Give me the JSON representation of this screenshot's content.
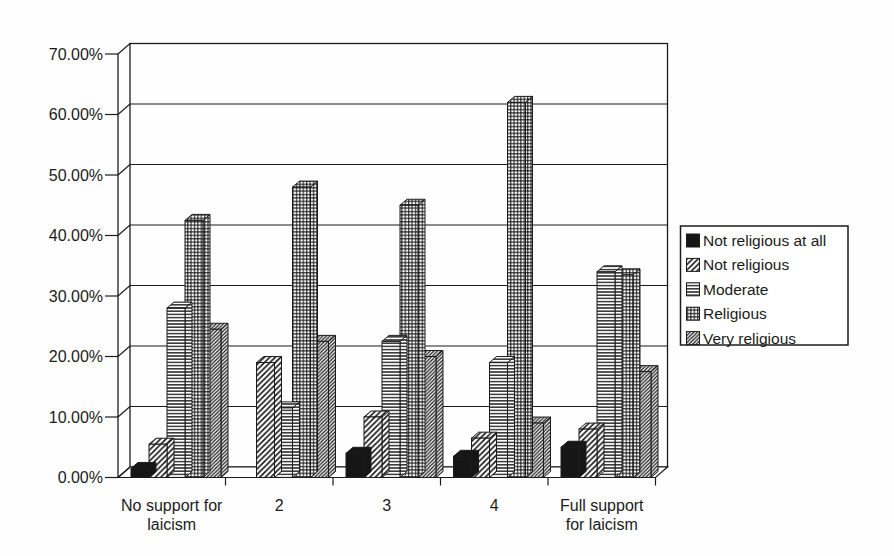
{
  "chart_data": {
    "type": "bar",
    "title": "",
    "xlabel": "",
    "ylabel": "",
    "categories": [
      "No support for\nlaicism",
      "2",
      "3",
      "4",
      "Full support\nfor laicism"
    ],
    "series": [
      {
        "name": "Not religious at all",
        "pattern": "solid",
        "values": [
          1.5,
          0,
          4,
          3.5,
          5
        ]
      },
      {
        "name": "Not religious",
        "pattern": "diag-sparse",
        "values": [
          5.5,
          19,
          10,
          6.5,
          8
        ]
      },
      {
        "name": "Moderate",
        "pattern": "hlines",
        "values": [
          28,
          11.5,
          22.5,
          19,
          34
        ]
      },
      {
        "name": "Religious",
        "pattern": "grid",
        "values": [
          42.5,
          48,
          45,
          62,
          33.5
        ]
      },
      {
        "name": "Very religious",
        "pattern": "diag-dense",
        "values": [
          24.5,
          22.5,
          20,
          9,
          17.5
        ]
      }
    ],
    "ylim": [
      0,
      70
    ],
    "ytick_step": 10,
    "ytick_labels": [
      "0.00%",
      "10.00%",
      "20.00%",
      "30.00%",
      "40.00%",
      "50.00%",
      "60.00%",
      "70.00%"
    ],
    "grid": true,
    "legend_position": "right",
    "style_3d": true,
    "colors": {
      "ink": "#1b1b1b",
      "bar_fill_solid": "#161616",
      "wall": "#fefefe"
    }
  }
}
